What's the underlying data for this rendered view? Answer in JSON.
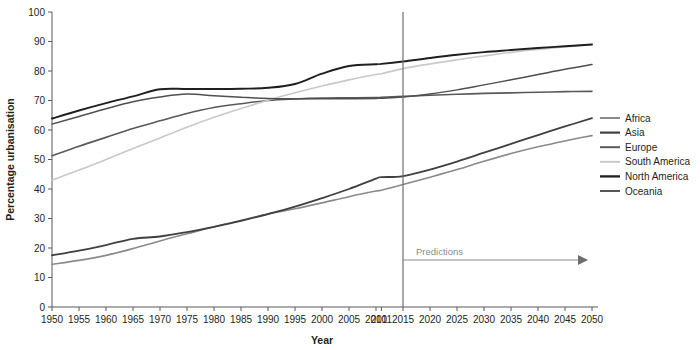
{
  "chart_data": {
    "type": "line",
    "title": "",
    "xlabel": "Year",
    "ylabel": "Percentage urbanisation",
    "xlim": [
      1950,
      2050
    ],
    "ylim": [
      0,
      100
    ],
    "grid": false,
    "legend_position": "right",
    "x_tick_labels": [
      "1950",
      "1955",
      "1960",
      "1965",
      "1970",
      "1975",
      "1980",
      "1985",
      "1990",
      "1995",
      "2000",
      "2005",
      "2010",
      "2011",
      "2015",
      "2020",
      "2025",
      "2030",
      "2035",
      "2040",
      "2045",
      "2050"
    ],
    "x_tick_values": [
      1950,
      1955,
      1960,
      1965,
      1970,
      1975,
      1980,
      1985,
      1990,
      1995,
      2000,
      2005,
      2010,
      2011,
      2015,
      2020,
      2025,
      2030,
      2035,
      2040,
      2045,
      2050
    ],
    "y_tick_labels": [
      "0",
      "10",
      "20",
      "30",
      "40",
      "50",
      "60",
      "70",
      "80",
      "90",
      "100"
    ],
    "y_tick_values": [
      0,
      10,
      20,
      30,
      40,
      50,
      60,
      70,
      80,
      90,
      100
    ],
    "x": [
      1950,
      1955,
      1960,
      1965,
      1970,
      1975,
      1980,
      1985,
      1990,
      1995,
      2000,
      2005,
      2010,
      2011,
      2015,
      2020,
      2025,
      2030,
      2035,
      2040,
      2045,
      2050
    ],
    "series": [
      {
        "name": "Africa",
        "color": "#8a8a8a",
        "width": 1.6,
        "values": [
          14.5,
          15.8,
          17.5,
          19.8,
          22.4,
          24.8,
          27.2,
          29.4,
          31.5,
          33.3,
          35.3,
          37.4,
          39.3,
          39.6,
          41.5,
          44.0,
          46.6,
          49.4,
          52.0,
          54.3,
          56.3,
          58.1
        ]
      },
      {
        "name": "Asia",
        "color": "#404040",
        "width": 1.8,
        "values": [
          17.5,
          19.1,
          21.0,
          23.1,
          23.9,
          25.4,
          27.2,
          29.2,
          31.5,
          34.0,
          36.9,
          40.0,
          43.5,
          44.0,
          44.4,
          46.6,
          49.3,
          52.3,
          55.3,
          58.3,
          61.2,
          64.0
        ]
      },
      {
        "name": "Europe",
        "color": "#595959",
        "width": 1.6,
        "values": [
          51.3,
          54.5,
          57.5,
          60.5,
          63.1,
          65.6,
          67.6,
          68.9,
          70.0,
          70.5,
          70.8,
          70.9,
          71.0,
          71.1,
          71.4,
          71.8,
          72.1,
          72.4,
          72.6,
          72.8,
          73.0,
          73.1
        ]
      },
      {
        "name": "South America",
        "color": "#c9c9c9",
        "width": 1.6,
        "values": [
          43.0,
          46.4,
          50.0,
          53.7,
          57.3,
          60.9,
          64.3,
          67.3,
          70.1,
          72.6,
          74.9,
          77.0,
          78.8,
          79.1,
          80.8,
          82.4,
          83.8,
          85.1,
          86.3,
          87.3,
          88.2,
          89.0
        ]
      },
      {
        "name": "North America",
        "color": "#1f1f1f",
        "width": 1.9,
        "values": [
          63.9,
          66.6,
          69.1,
          71.4,
          73.8,
          73.9,
          73.9,
          74.0,
          74.3,
          75.6,
          79.1,
          81.7,
          82.3,
          82.4,
          83.2,
          84.4,
          85.5,
          86.4,
          87.1,
          87.8,
          88.4,
          89.0
        ]
      },
      {
        "name": "Oceania",
        "color": "#4f4f4f",
        "width": 1.5,
        "values": [
          62.0,
          64.6,
          67.2,
          69.6,
          71.2,
          72.2,
          71.6,
          71.1,
          70.7,
          70.6,
          70.6,
          70.6,
          70.7,
          70.8,
          71.2,
          72.2,
          73.6,
          75.3,
          77.0,
          78.8,
          80.6,
          82.2
        ]
      }
    ],
    "annotations": [
      {
        "name": "predictions",
        "label": "Predictions",
        "at_x": 2015
      }
    ]
  },
  "legend": {
    "entries": [
      "Africa",
      "Asia",
      "Europe",
      "South America",
      "North America",
      "Oceania"
    ]
  },
  "axes": {
    "x_title": "Year",
    "y_title": "Percentage urbanisation"
  }
}
